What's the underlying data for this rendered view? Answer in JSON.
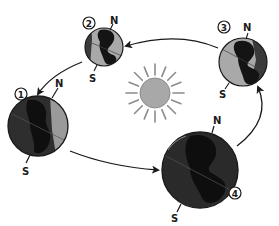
{
  "diagram": {
    "colors": {
      "background": "#ffffff",
      "sun_fill": "#a8a8a8",
      "sun_rays": "#8c8c8c",
      "ocean": "#a9a9a9",
      "land": "#141414",
      "shadow": "#3a3a3a",
      "outline": "#1a1a1a",
      "arrow": "#1a1a1a"
    },
    "sun": {
      "label": ""
    },
    "positions": [
      {
        "number": "1",
        "north_label": "N",
        "south_label": "S"
      },
      {
        "number": "2",
        "north_label": "N",
        "south_label": "S"
      },
      {
        "number": "3",
        "north_label": "N",
        "south_label": "S"
      },
      {
        "number": "4",
        "north_label": "N",
        "south_label": "S"
      }
    ],
    "orbit_direction": "counterclockwise (4 → 3 → 2 → 1 → 4)"
  }
}
